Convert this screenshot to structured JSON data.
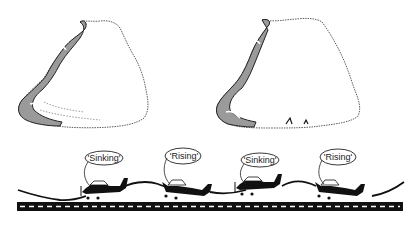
{
  "diagram": {
    "clouds": [
      {
        "name": "left-cloud"
      },
      {
        "name": "right-cloud"
      }
    ],
    "airplanes": [
      {
        "label": "'Sinking'",
        "x": 100,
        "y": 190
      },
      {
        "label": "'Rising'",
        "x": 188,
        "y": 188
      },
      {
        "label": "'Sinking'",
        "x": 262,
        "y": 186
      },
      {
        "label": "'Rising'",
        "x": 345,
        "y": 188
      }
    ],
    "colors": {
      "ink": "#111111",
      "shade": "#9a9a9a",
      "runway": "#111111",
      "runway_dash": "#ffffff"
    }
  }
}
